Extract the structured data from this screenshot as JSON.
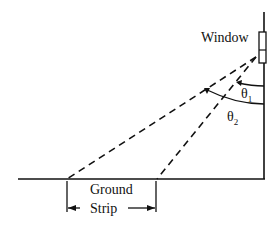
{
  "diagram": {
    "labels": {
      "window": "Window",
      "theta1_symbol": "θ",
      "theta1_sub": "1",
      "theta2_symbol": "θ",
      "theta2_sub": "2",
      "ground_line1": "Ground",
      "ground_line2": "Strip"
    },
    "colors": {
      "stroke": "#111111",
      "background": "#ffffff"
    }
  }
}
